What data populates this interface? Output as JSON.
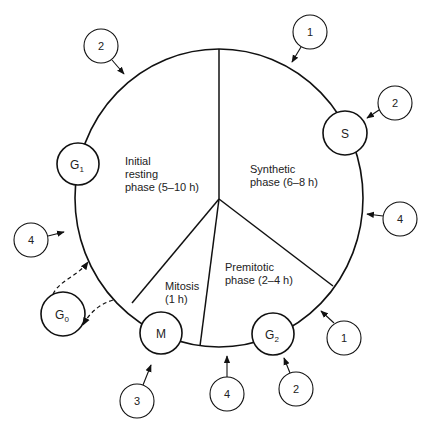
{
  "diagram": {
    "phases": [
      {
        "id": "g1",
        "lines": [
          "Initial",
          "resting",
          "phase (5–10 h)"
        ]
      },
      {
        "id": "s",
        "lines": [
          "Synthetic",
          "phase (6–8 h)"
        ]
      },
      {
        "id": "g2",
        "lines": [
          "Premitotic",
          "phase (2–4 h)"
        ]
      },
      {
        "id": "m",
        "lines": [
          "Mitosis",
          "(1 h)"
        ]
      }
    ],
    "nodes": {
      "g1": {
        "main": "G",
        "sub": "1"
      },
      "s": {
        "main": "S",
        "sub": ""
      },
      "g2": {
        "main": "G",
        "sub": "2"
      },
      "m": {
        "main": "M",
        "sub": ""
      },
      "g0": {
        "main": "G",
        "sub": "0"
      }
    },
    "markers": [
      {
        "id": "marker-top-left",
        "label": "2"
      },
      {
        "id": "marker-top",
        "label": "1"
      },
      {
        "id": "marker-right-upper",
        "label": "2"
      },
      {
        "id": "marker-right",
        "label": "4"
      },
      {
        "id": "marker-left",
        "label": "4"
      },
      {
        "id": "marker-bottom-right",
        "label": "1"
      },
      {
        "id": "marker-bottom-left",
        "label": "3"
      },
      {
        "id": "marker-bottom",
        "label": "4"
      },
      {
        "id": "marker-bottom-right2",
        "label": "2"
      }
    ]
  }
}
